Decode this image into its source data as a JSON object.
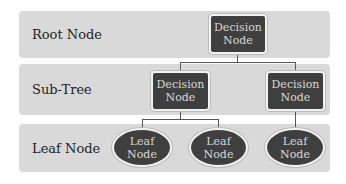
{
  "levels": {
    "root": "Root Node",
    "subtree": "Sub-Tree",
    "leaf": "Leaf Node"
  },
  "nodes": {
    "root_decision": "Decision\nNode",
    "sub_decision_left": "Decision\nNode",
    "sub_decision_right": "Decision\nNode",
    "leaf_1": "Leaf\nNode",
    "leaf_2": "Leaf\nNode",
    "leaf_3": "Leaf\nNode"
  },
  "colors": {
    "band": "#d9d9d9",
    "node_fill": "#3f3f3f",
    "node_text": "#d8d8d8"
  }
}
